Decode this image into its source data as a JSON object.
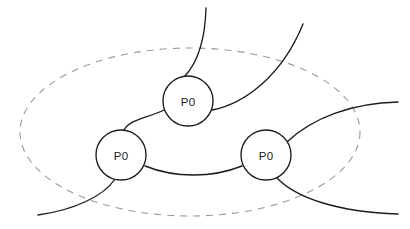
{
  "diagram": {
    "type": "node-link-diagram",
    "canvas": {
      "width": 410,
      "height": 229,
      "background": "#ffffff"
    },
    "boundary": {
      "name": "dashed-boundary-region",
      "shape": "ellipse",
      "cx": 190,
      "cy": 132,
      "rx": 170,
      "ry": 84,
      "stroke": "#9a9a9a",
      "dash": "7 6"
    },
    "nodes": [
      {
        "id": "node-top",
        "label": "P0",
        "cx": 188,
        "cy": 101,
        "r": 25,
        "stroke": "#1c1c1c",
        "fill": "#ffffff"
      },
      {
        "id": "node-left",
        "label": "P0",
        "cx": 121,
        "cy": 155,
        "r": 25,
        "stroke": "#1c1c1c",
        "fill": "#ffffff"
      },
      {
        "id": "node-right",
        "label": "P0",
        "cx": 266,
        "cy": 155,
        "r": 25,
        "stroke": "#1c1c1c",
        "fill": "#ffffff"
      }
    ],
    "edges": [
      {
        "id": "edge-top-to-north-stub",
        "from": "node-top",
        "to": "external-north",
        "path": "M 185 76 C 196 64 205 44 206 8",
        "stroke": "#1c1c1c"
      },
      {
        "id": "edge-top-to-northeast-stub",
        "from": "node-top",
        "to": "external-northeast",
        "path": "M 212 110 C 244 104 282 76 303 24",
        "stroke": "#1c1c1c"
      },
      {
        "id": "edge-top-to-left",
        "from": "node-top",
        "to": "node-left",
        "path": "M 164 110 C 148 118 130 119 124 130",
        "stroke": "#1c1c1c"
      },
      {
        "id": "edge-left-to-right",
        "from": "node-left",
        "to": "node-right",
        "path": "M 145 166 C 175 178 212 178 242 166",
        "stroke": "#1c1c1c"
      },
      {
        "id": "edge-left-to-southwest-stub",
        "from": "node-left",
        "to": "external-southwest",
        "path": "M 115 179 C 104 196 74 210 38 215",
        "stroke": "#1c1c1c"
      },
      {
        "id": "edge-right-to-east-stub",
        "from": "node-right",
        "to": "external-east",
        "path": "M 287 142 C 312 118 352 103 398 102",
        "stroke": "#1c1c1c"
      },
      {
        "id": "edge-right-to-southeast-stub",
        "from": "node-right",
        "to": "external-southeast",
        "path": "M 277 178 C 296 198 338 212 398 214",
        "stroke": "#1c1c1c"
      }
    ]
  }
}
